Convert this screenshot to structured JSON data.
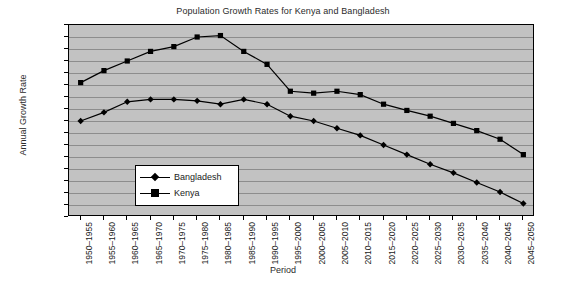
{
  "chart_data": {
    "type": "line",
    "title": "Population Growth Rates for Kenya and Bangladesh",
    "xlabel": "Period",
    "ylabel": "Annual Growth Rate",
    "ylim": [
      0,
      4
    ],
    "ytick_step": 0.25,
    "grid": true,
    "legend_position": "inside-lower-left",
    "categories": [
      "1950–1955",
      "1955–1960",
      "1960–1965",
      "1965–1970",
      "1970–1975",
      "1975–1980",
      "1980–1985",
      "1985–1990",
      "1990–1995",
      "1995–2000",
      "2000–2005",
      "2005–2010",
      "2010–2015",
      "2015–2020",
      "2020–2025",
      "2025–2030",
      "2030–2035",
      "2035–2040",
      "2040–2045",
      "2045–2050"
    ],
    "yticks": [
      "0",
      "0.25",
      "0.5",
      "0.75",
      "1",
      "1.25",
      "1.5",
      "1.75",
      "2",
      "2.25",
      "2.5",
      "2.75",
      "3",
      "3.25",
      "3.5",
      "3.75",
      "4"
    ],
    "series": [
      {
        "name": "Bangladesh",
        "marker": "diamond",
        "color": "#000000",
        "values": [
          2.0,
          2.18,
          2.4,
          2.45,
          2.45,
          2.42,
          2.35,
          2.45,
          2.35,
          2.1,
          2.0,
          1.85,
          1.7,
          1.5,
          1.3,
          1.1,
          0.92,
          0.72,
          0.52,
          0.28
        ]
      },
      {
        "name": "Kenya",
        "marker": "square",
        "color": "#000000",
        "values": [
          2.8,
          3.05,
          3.25,
          3.45,
          3.55,
          3.75,
          3.78,
          3.45,
          3.18,
          2.62,
          2.58,
          2.62,
          2.55,
          2.35,
          2.22,
          2.1,
          1.95,
          1.8,
          1.62,
          1.3
        ]
      }
    ]
  },
  "legend": {
    "items": [
      {
        "label": "Bangladesh"
      },
      {
        "label": "Kenya"
      }
    ]
  },
  "colors": {
    "plot_background": "#c2c2c2",
    "gridline": "#8d8d8d",
    "frame": "#000000",
    "figure_background": "#ffffff",
    "series": "#000000"
  }
}
